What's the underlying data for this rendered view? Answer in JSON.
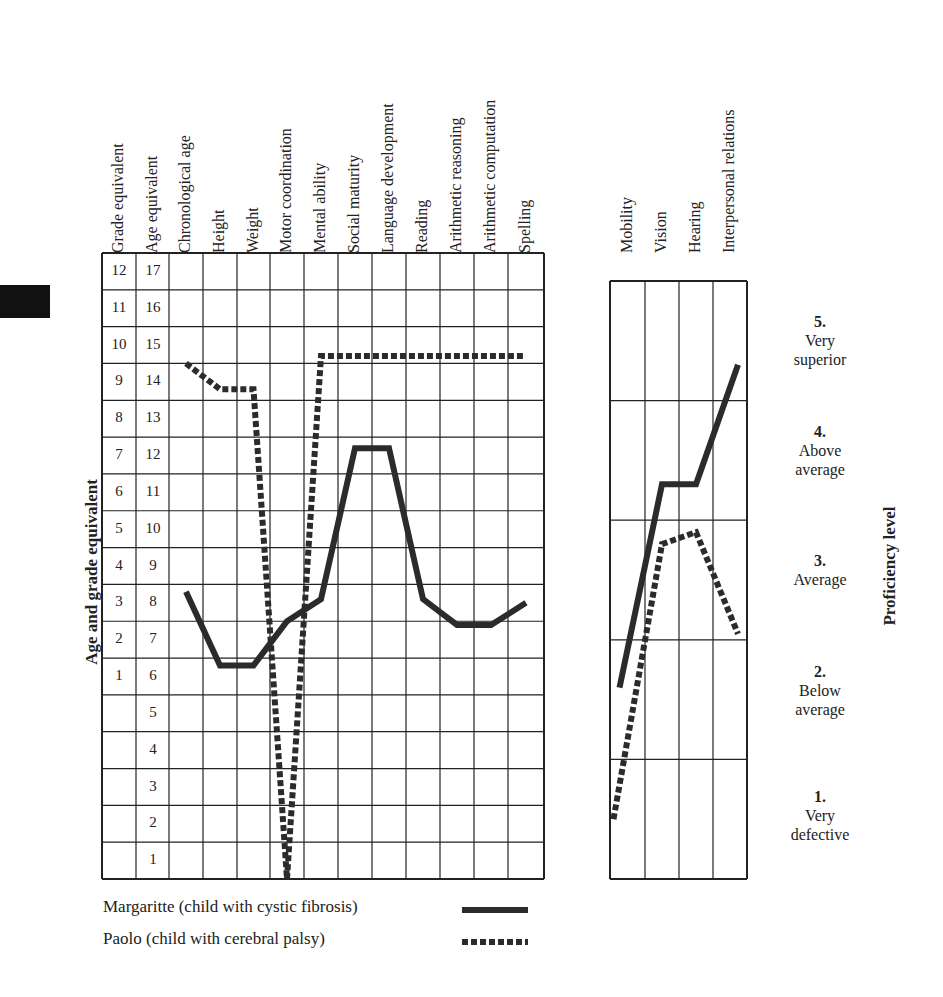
{
  "chart_data": [
    {
      "type": "line",
      "title": "",
      "ylabel": "Age and grade equivalent",
      "x_categories": [
        "Chronological age",
        "Height",
        "Weight",
        "Motor coordination",
        "Mental ability",
        "Social maturity",
        "Language development",
        "Reading",
        "Arithmetic reasoning",
        "Arithmetic computation",
        "Spelling"
      ],
      "y_axis_columns": [
        "Grade equivalent",
        "Age equivalent"
      ],
      "grade_ticks": [
        12,
        11,
        10,
        9,
        8,
        7,
        6,
        5,
        4,
        3,
        2,
        1
      ],
      "age_ticks": [
        17,
        16,
        15,
        14,
        13,
        12,
        11,
        10,
        9,
        8,
        7,
        6,
        5,
        4,
        3,
        2,
        1
      ],
      "ylim_age": [
        0,
        17
      ],
      "grid": true,
      "series": [
        {
          "name": "Margaritte (child with cystic fibrosis)",
          "style": "solid",
          "values": [
            8.3,
            6.3,
            6.3,
            7.5,
            8.1,
            12.2,
            12.2,
            8.1,
            7.4,
            7.4,
            8.0
          ]
        },
        {
          "name": "Paolo (child with cerebral palsy)",
          "style": "dashed",
          "values": [
            14.5,
            13.8,
            13.8,
            0.5,
            14.7,
            14.7,
            14.7,
            14.7,
            14.7,
            14.7,
            14.7
          ]
        }
      ]
    },
    {
      "type": "line",
      "title": "",
      "ylabel": "Proficiency level",
      "x_categories": [
        "Mobility",
        "Vision",
        "Hearing",
        "Interpersonal relations"
      ],
      "levels": [
        {
          "num": "5.",
          "text": [
            "Very",
            "superior"
          ]
        },
        {
          "num": "4.",
          "text": [
            "Above",
            "average"
          ]
        },
        {
          "num": "3.",
          "text": [
            "Average"
          ]
        },
        {
          "num": "2.",
          "text": [
            "Below",
            "average"
          ]
        },
        {
          "num": "1.",
          "text": [
            "Very",
            "defective"
          ]
        }
      ],
      "ylim": [
        0,
        5
      ],
      "grid": true,
      "series": [
        {
          "name": "Margaritte (child with cystic fibrosis)",
          "style": "solid",
          "values": [
            1.6,
            3.3,
            3.3,
            4.3
          ]
        },
        {
          "name": "Paolo (child with cerebral palsy)",
          "style": "dashed",
          "values": [
            0.5,
            2.8,
            2.9,
            2.05
          ]
        }
      ]
    }
  ],
  "headers": {
    "main": [
      "Grade equivalent",
      "Age equivalent",
      "Chronological age",
      "Height",
      "Weight",
      "Motor coordination",
      "Mental ability",
      "Social maturity",
      "Language development",
      "Reading",
      "Arithmetic reasoning",
      "Arithmetic computation",
      "Spelling"
    ],
    "right": [
      "Mobility",
      "Vision",
      "Hearing",
      "Interpersonal relations"
    ]
  },
  "axis_titles": {
    "left": "Age and grade equivalent",
    "right": "Proficiency level"
  },
  "legend": {
    "margaritte": "Margaritte  (child with cystic fibrosis)",
    "paolo": "Paolo  (child with cerebral palsy)"
  },
  "colors": {
    "line": "#2b2b2b",
    "grid": "#222222"
  }
}
